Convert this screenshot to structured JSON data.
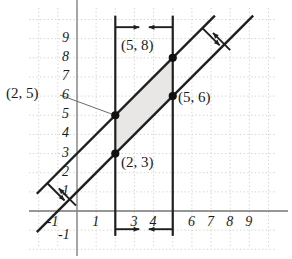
{
  "chart_data": {
    "type": "line",
    "title": "",
    "xlabel": "",
    "ylabel": "",
    "xlim": [
      -1.9,
      10.2
    ],
    "ylim": [
      -1.6,
      10.4
    ],
    "grid": true,
    "grid_style": "dotted",
    "legend": null,
    "x_tick_labels": [
      "-1",
      "1",
      "3",
      "4",
      "6",
      "7",
      "8",
      "9"
    ],
    "x_tick_values": [
      -1,
      1,
      3,
      4,
      6,
      7,
      8,
      9
    ],
    "y_tick_labels": [
      "9",
      "8",
      "7",
      "6",
      "5",
      "4",
      "3",
      "2",
      "1",
      "-1"
    ],
    "y_tick_values": [
      9,
      8,
      7,
      6,
      5,
      4,
      3,
      2,
      1,
      -1
    ],
    "series": [
      {
        "name": "upper-diagonal",
        "type": "line",
        "slope": 1,
        "intercept": 3,
        "equation": "y = x + 3",
        "x_range": [
          -2.1,
          7.2
        ]
      },
      {
        "name": "lower-diagonal",
        "type": "line",
        "slope": 1,
        "intercept": 1,
        "equation": "y = x + 1",
        "x_range": [
          -2.1,
          9.2
        ]
      },
      {
        "name": "left-vertical",
        "type": "vline",
        "x": 2,
        "equation": "x = 2",
        "y_range": [
          -1.3,
          10.2
        ]
      },
      {
        "name": "right-vertical",
        "type": "vline",
        "x": 5,
        "equation": "x = 5",
        "y_range": [
          -1.3,
          10.2
        ]
      }
    ],
    "shaded_region": {
      "name": "solution-parallelogram",
      "fill": "#e6e6e6",
      "vertices": [
        [
          2,
          5
        ],
        [
          5,
          8
        ],
        [
          5,
          6
        ],
        [
          2,
          3
        ]
      ]
    },
    "points": [
      {
        "label": "(2, 5)",
        "x": 2,
        "y": 5,
        "label_position": "left-offset",
        "has_leader_line": true
      },
      {
        "label": "(2, 3)",
        "x": 2,
        "y": 3,
        "label_position": "right-below",
        "has_leader_line": false
      },
      {
        "label": "(5, 8)",
        "x": 5,
        "y": 8,
        "label_position": "left",
        "has_leader_line": false
      },
      {
        "label": "(5, 6)",
        "x": 5,
        "y": 6,
        "label_position": "right-below",
        "has_leader_line": false
      }
    ],
    "direction_arrows": [
      {
        "name": "top-left-vertical-arrow",
        "points": "right",
        "at": "top of x=2 line"
      },
      {
        "name": "top-right-vertical-arrow",
        "points": "left",
        "at": "top of x=5 line"
      },
      {
        "name": "bottom-left-vertical-arrow",
        "points": "right",
        "at": "bottom of x=2 line"
      },
      {
        "name": "bottom-right-vertical-arrow",
        "points": "left",
        "at": "bottom of x=5 line"
      },
      {
        "name": "top-upper-diagonal-arrow",
        "points": "down-right-perpendicular",
        "at": "top end of upper diagonal"
      },
      {
        "name": "top-lower-diagonal-arrow",
        "points": "up-left-perpendicular",
        "at": "top end of lower diagonal"
      },
      {
        "name": "bottom-upper-diagonal-arrow",
        "points": "down-right-perpendicular",
        "at": "bottom end of upper diagonal"
      },
      {
        "name": "bottom-lower-diagonal-arrow",
        "points": "up-left-perpendicular",
        "at": "bottom end of lower diagonal"
      }
    ],
    "colors": {
      "axis": "#6e6e6e",
      "grid": "#d8d4d0",
      "line": "#1f1f1f",
      "shade": "#e6e6e6",
      "point": "#111111",
      "text": "#1a1a1a"
    }
  },
  "axis_labels": {
    "x": [
      {
        "text": "-1",
        "x": -1
      },
      {
        "text": "1",
        "x": 1
      },
      {
        "text": "3",
        "x": 3
      },
      {
        "text": "4",
        "x": 4
      },
      {
        "text": "6",
        "x": 6
      },
      {
        "text": "7",
        "x": 7
      },
      {
        "text": "8",
        "x": 8
      },
      {
        "text": "9",
        "x": 9
      }
    ],
    "y": [
      {
        "text": "9",
        "y": 9
      },
      {
        "text": "8",
        "y": 8
      },
      {
        "text": "7",
        "y": 7
      },
      {
        "text": "6",
        "y": 6
      },
      {
        "text": "5",
        "y": 5
      },
      {
        "text": "4",
        "y": 4
      },
      {
        "text": "3",
        "y": 3
      },
      {
        "text": "2",
        "y": 2
      },
      {
        "text": "1",
        "y": 1
      },
      {
        "text": "-1",
        "y": -1
      }
    ]
  },
  "point_labels": {
    "p25": "(2, 5)",
    "p23": "(2, 3)",
    "p58": "(5, 8)",
    "p56": "(5, 6)"
  }
}
